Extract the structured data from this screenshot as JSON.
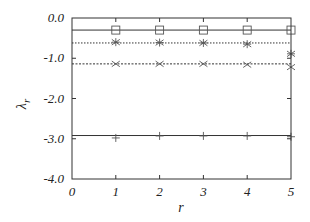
{
  "chart_data": {
    "type": "line",
    "title": "",
    "xlabel": "r",
    "ylabel": "λ_r",
    "ylabel_main": "λ",
    "ylabel_sub": "r",
    "xlim": [
      0,
      5
    ],
    "ylim": [
      -4.0,
      0.0
    ],
    "grid": false,
    "legend": null,
    "x_ticks": [
      0,
      1,
      2,
      3,
      4,
      5
    ],
    "x_tick_labels": [
      "0",
      "1",
      "2",
      "3",
      "4",
      "5"
    ],
    "y_ticks": [
      0.0,
      -1.0,
      -2.0,
      -3.0,
      -4.0
    ],
    "y_tick_labels": [
      "0.0",
      "-1.0",
      "-2.0",
      "-3.0",
      "-4.0"
    ],
    "reference_lines": [
      {
        "name": "level-1",
        "y": -0.3,
        "style": "solid"
      },
      {
        "name": "level-2",
        "y": -0.62,
        "style": "dotted"
      },
      {
        "name": "level-3",
        "y": -1.14,
        "style": "dashed"
      },
      {
        "name": "level-4",
        "y": -2.92,
        "style": "solid"
      }
    ],
    "series": [
      {
        "name": "square",
        "marker": "square",
        "x": [
          1,
          2,
          3,
          4,
          5
        ],
        "values": [
          -0.3,
          -0.3,
          -0.3,
          -0.3,
          -0.3
        ]
      },
      {
        "name": "star",
        "marker": "star",
        "x": [
          1,
          2,
          3,
          4,
          5
        ],
        "values": [
          -0.6,
          -0.61,
          -0.62,
          -0.65,
          -0.89
        ]
      },
      {
        "name": "cross",
        "marker": "cross",
        "x": [
          1,
          2,
          3,
          4,
          5
        ],
        "values": [
          -1.14,
          -1.14,
          -1.14,
          -1.16,
          -1.22
        ]
      },
      {
        "name": "plus",
        "marker": "plus",
        "x": [
          1,
          2,
          3,
          4,
          5
        ],
        "values": [
          -2.98,
          -2.93,
          -2.93,
          -2.93,
          -2.95
        ]
      }
    ]
  }
}
